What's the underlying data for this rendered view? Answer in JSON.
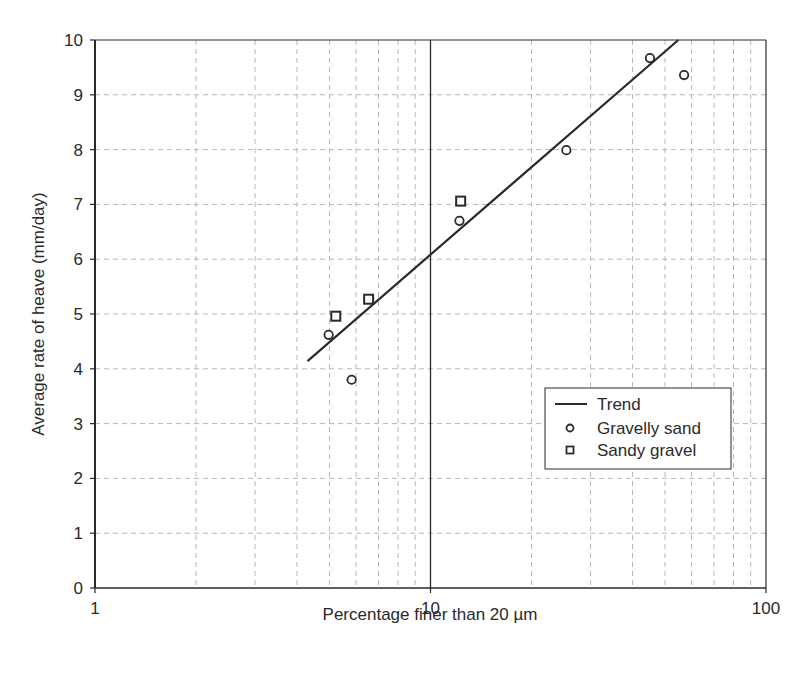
{
  "chart_data": {
    "type": "scatter",
    "title": "",
    "xlabel": "Percentage finer than 20 µm",
    "ylabel": "Average rate of heave (mm/day)",
    "xscale": "log",
    "xlim": [
      1,
      100
    ],
    "ylim": [
      0,
      10
    ],
    "x_ticks": [
      "1",
      "10",
      "100"
    ],
    "y_ticks": [
      "0",
      "1",
      "2",
      "3",
      "4",
      "5",
      "6",
      "7",
      "8",
      "9",
      "10"
    ],
    "grid": true,
    "legend_position": "lower right",
    "series": [
      {
        "name": "Trend",
        "kind": "line",
        "points": [
          [
            4.3,
            4.14
          ],
          [
            54.8,
            10.0
          ]
        ]
      },
      {
        "name": "Gravelly sand",
        "kind": "marker",
        "marker": "circle",
        "points": [
          [
            4.97,
            4.62
          ],
          [
            5.82,
            3.8
          ],
          [
            12.2,
            6.7
          ],
          [
            25.4,
            7.99
          ],
          [
            45.1,
            9.67
          ],
          [
            57.0,
            9.36
          ]
        ]
      },
      {
        "name": "Sandy gravel",
        "kind": "marker",
        "marker": "square",
        "points": [
          [
            5.22,
            4.96
          ],
          [
            6.54,
            5.27
          ],
          [
            12.3,
            7.06
          ]
        ]
      }
    ]
  },
  "colors": {
    "ink": "#2a2a2a",
    "grid": "#b8b8b8",
    "background": "#ffffff"
  }
}
